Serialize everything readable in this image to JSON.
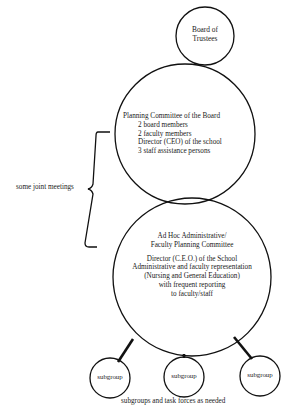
{
  "diagram": {
    "board": {
      "label_line1": "Board of",
      "label_line2": "Trustees"
    },
    "planning_committee": {
      "title": "Planning Committee of the Board",
      "members": [
        "2 board members",
        "2 faculty members",
        "Director (CEO) of the school",
        "3 staff assistance persons"
      ]
    },
    "joint_meetings_label": "some joint meetings",
    "adhoc_committee": {
      "title_line1": "Ad Hoc Administrative/",
      "title_line2": "Faculty Planning Committee",
      "details": [
        "Director (C.E.O.) of the School",
        "Administrative and faculty representation",
        "(Nursing and General Education)",
        "with frequent reporting",
        "to faculty/staff"
      ]
    },
    "subgroups": [
      {
        "label": "subgroup"
      },
      {
        "label": "subgroup"
      },
      {
        "label": "subgroup"
      }
    ],
    "caption": "subgroups and task forces as needed",
    "colors": {
      "stroke": "#111111",
      "background": "#ffffff"
    }
  }
}
